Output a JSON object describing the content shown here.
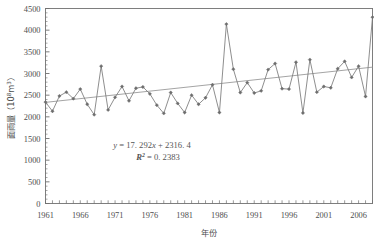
{
  "chart_data": {
    "type": "line",
    "title": "",
    "xlabel": "年份",
    "ylabel": "面雨量（10⁸m³）",
    "ylabel_main": "面雨量",
    "ylabel_unit_open": "（10",
    "ylabel_unit_exp1": "8",
    "ylabel_unit_mid": "m",
    "ylabel_unit_exp2": "3",
    "ylabel_unit_close": "）",
    "ylim": [
      0,
      4500
    ],
    "ytick_step": 500,
    "yticks": [
      0,
      500,
      1000,
      1500,
      2000,
      2500,
      3000,
      3500,
      4000,
      4500
    ],
    "ytick_labels": [
      "0",
      "500",
      "1000",
      "1500",
      "2000",
      "2500",
      "3000",
      "3500",
      "4000",
      "4500"
    ],
    "xlim": [
      1961,
      2008
    ],
    "xtick_step": 1,
    "xtick_label_step": 5,
    "xtick_labels": [
      "1961",
      "1966",
      "1971",
      "1976",
      "1981",
      "1986",
      "1991",
      "1996",
      "2001",
      "2006"
    ],
    "xtick_label_years": [
      1961,
      1966,
      1971,
      1976,
      1981,
      1986,
      1991,
      1996,
      2001,
      2006
    ],
    "grid": false,
    "legend": "none",
    "marker": "diamond",
    "series": [
      {
        "name": "面雨量",
        "x": [
          1961,
          1962,
          1963,
          1964,
          1965,
          1966,
          1967,
          1968,
          1969,
          1970,
          1971,
          1972,
          1973,
          1974,
          1975,
          1976,
          1977,
          1978,
          1979,
          1980,
          1981,
          1982,
          1983,
          1984,
          1985,
          1986,
          1987,
          1988,
          1989,
          1990,
          1991,
          1992,
          1993,
          1994,
          1995,
          1996,
          1997,
          1998,
          1999,
          2000,
          2001,
          2002,
          2003,
          2004,
          2005,
          2006,
          2007,
          2008
        ],
        "values": [
          2340,
          2130,
          2480,
          2570,
          2420,
          2640,
          2290,
          2050,
          3170,
          2160,
          2450,
          2700,
          2370,
          2660,
          2690,
          2530,
          2270,
          2080,
          2560,
          2310,
          2100,
          2500,
          2290,
          2440,
          2740,
          2100,
          4140,
          3100,
          2560,
          2790,
          2550,
          2600,
          3090,
          3230,
          2650,
          2640,
          3260,
          2090,
          3320,
          2570,
          2700,
          2670,
          3110,
          3280,
          2910,
          3170,
          2470,
          4300
        ]
      }
    ],
    "trendline": {
      "type": "linear",
      "equation_y": "y",
      "equation_eq": " = 17. 292",
      "equation_x": "x",
      "equation_tail": " + 2316. 4",
      "equation_text": "y = 17.292x + 2316.4",
      "r2_label": "R",
      "r2_exponent": "2",
      "r2_value": " = 0. 2383",
      "r2_text": "R² = 0.2383",
      "slope": 17.292,
      "intercept": 2316.4,
      "r_squared": 0.2383,
      "start_value": 2333.7,
      "end_value": 3146.4
    },
    "colors": {
      "line": "#7a7a7a",
      "marker": "#6d6d6d",
      "trend": "#9a9a9a",
      "axis": "#6f6f6f",
      "text": "#4e4e4e",
      "background": "#ffffff"
    }
  }
}
